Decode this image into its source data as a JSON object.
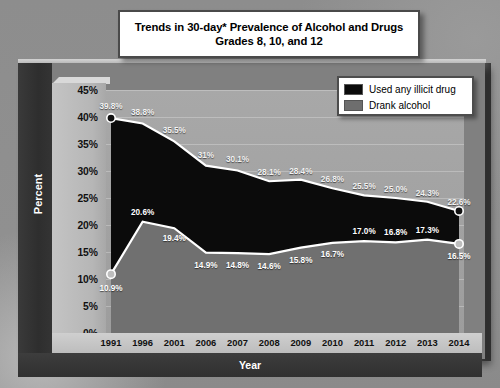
{
  "title": {
    "line1": "Trends in 30-day* Prevalence of Alcohol and Drugs",
    "line2": "Grades 8, 10, and 12"
  },
  "axes": {
    "y_label": "Percent",
    "x_label": "Year",
    "y_ticks": [
      "45%",
      "40%",
      "35%",
      "30%",
      "25%",
      "20%",
      "15%",
      "10%",
      "5%",
      "0%"
    ]
  },
  "legend": {
    "items": [
      {
        "label": "Used any illicit drug",
        "color": "#0b0b0b"
      },
      {
        "label": "Drank alcohol",
        "color": "#6e6e6e"
      }
    ]
  },
  "colors": {
    "illicit_area": "#0b0b0b",
    "alcohol_area": "#707070",
    "series_line": "#ffffff",
    "plot_bg": "#a3a3a3",
    "frame": "#808080",
    "dark_band": "#343434",
    "title_box_bg": "#ffffff"
  },
  "chart_data": {
    "type": "area",
    "title": "Trends in 30-day* Prevalence of Alcohol and Drugs Grades 8, 10, and 12",
    "xlabel": "Year",
    "ylabel": "Percent",
    "ylim": [
      0,
      45
    ],
    "grid": true,
    "legend_position": "top-right",
    "stacked": false,
    "categories": [
      "1991",
      "1996",
      "2001",
      "2006",
      "2007",
      "2008",
      "2009",
      "2010",
      "2011",
      "2012",
      "2013",
      "2014"
    ],
    "series": [
      {
        "name": "Used any illicit drug",
        "color": "#0b0b0b",
        "values": [
          39.8,
          38.8,
          35.5,
          31.0,
          30.1,
          28.1,
          28.4,
          26.8,
          25.5,
          25.0,
          24.3,
          22.6
        ],
        "labels": [
          "39.8%",
          "38.8%",
          "35.5%",
          "31%",
          "30.1%",
          "28.1%",
          "28.4%",
          "26.8%",
          "25.5%",
          "25.0%",
          "24.3%",
          "22.6%"
        ]
      },
      {
        "name": "Drank alcohol",
        "color": "#707070",
        "values": [
          10.9,
          20.6,
          19.4,
          14.9,
          14.8,
          14.6,
          15.8,
          16.7,
          17.0,
          16.8,
          17.3,
          16.5
        ],
        "labels": [
          "10.9%",
          "20.6%",
          "19.4%",
          "14.9%",
          "14.8%",
          "14.6%",
          "15.8%",
          "16.7%",
          "17.0%",
          "16.8%",
          "17.3%",
          "16.5%"
        ]
      }
    ]
  }
}
